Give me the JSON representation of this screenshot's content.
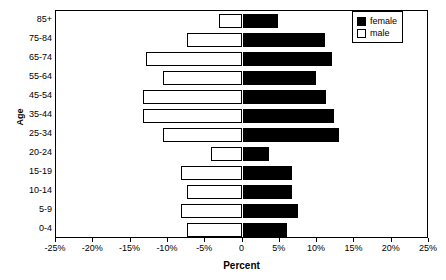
{
  "chart_data": {
    "type": "bar",
    "title": "",
    "subtitle": "",
    "xlabel": "Percent",
    "ylabel": "Age",
    "orientation": "horizontal",
    "style": "population-pyramid",
    "grid": false,
    "legend_position": "top-right",
    "xlim": [
      -25,
      25
    ],
    "xticks": [
      -25,
      -20,
      -15,
      -10,
      -5,
      0,
      5,
      10,
      15,
      20,
      25
    ],
    "xtick_labels": [
      "-25%",
      "-20%",
      "-15%",
      "-10%",
      "-5%",
      "0",
      "5%",
      "10%",
      "15%",
      "20%",
      "25%"
    ],
    "categories": [
      "85+",
      "75-84",
      "65-74",
      "55-64",
      "45-54",
      "35-44",
      "25-34",
      "20-24",
      "15-19",
      "10-14",
      "5-9",
      "0-4"
    ],
    "series": [
      {
        "name": "male",
        "color": "#ffffff",
        "edge_color": "#000000",
        "side": "left",
        "values": [
          -3.2,
          -7.4,
          -13.0,
          -10.6,
          -13.4,
          -13.4,
          -10.6,
          -4.2,
          -8.2,
          -7.4,
          -8.2,
          -7.5
        ]
      },
      {
        "name": "female",
        "color": "#000000",
        "edge_color": "#000000",
        "side": "right",
        "values": [
          4.7,
          11.0,
          12.0,
          9.9,
          11.2,
          12.3,
          13.0,
          3.6,
          6.7,
          6.7,
          7.4,
          6.0
        ]
      }
    ]
  },
  "axes": {
    "y_title": "Age",
    "x_title": "Percent"
  },
  "legend": {
    "entries": [
      {
        "label": "female",
        "swatch": "filled-square-black"
      },
      {
        "label": "male",
        "swatch": "open-square-white"
      }
    ]
  }
}
